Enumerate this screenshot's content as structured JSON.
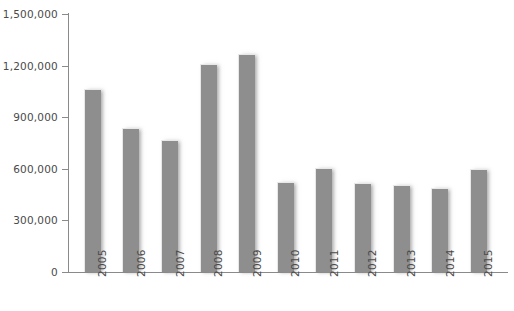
{
  "chart_data": {
    "type": "bar",
    "title": "",
    "subtitle": "",
    "xlabel": "",
    "ylabel": "",
    "categories": [
      "2005",
      "2006",
      "2007",
      "2008",
      "2009",
      "2010",
      "2011",
      "2012",
      "2013",
      "2014",
      "2015"
    ],
    "values": [
      1062000,
      840000,
      766000,
      1212000,
      1270000,
      523000,
      605000,
      520000,
      508000,
      488000,
      598000
    ],
    "ylim": [
      0,
      1500000
    ],
    "xlim": null,
    "y_ticks": [
      0,
      300000,
      600000,
      900000,
      1200000,
      1500000
    ],
    "y_tick_labels": [
      "0",
      "300,000",
      "600,000",
      "900,000",
      "1,200,000",
      "1,500,000"
    ],
    "grid": false,
    "legend": null,
    "legend_position": "none",
    "annotations": [],
    "series": [
      {
        "name": "",
        "values": [
          1062000,
          840000,
          766000,
          1212000,
          1270000,
          523000,
          605000,
          520000,
          508000,
          488000,
          598000
        ]
      }
    ]
  },
  "style": {
    "bar_color": "#8e8e8e",
    "bar_highlight_color": "#e8e8e8",
    "axis_color": "#8a8a8a",
    "tick_label_color": "#4a4a4a",
    "background_color": "#ffffff"
  }
}
